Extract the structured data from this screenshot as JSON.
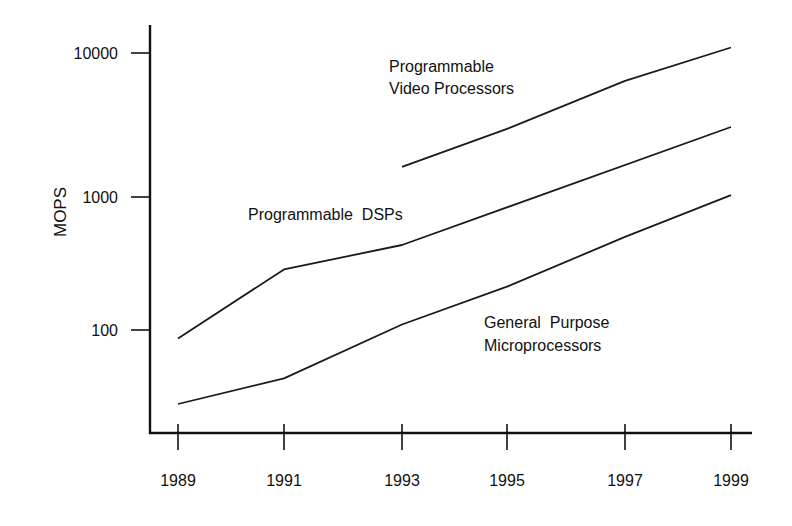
{
  "chart_data": {
    "type": "line",
    "title": "",
    "xlabel": "",
    "ylabel": "MOPS",
    "yscale": "log",
    "ylim": [
      20,
      14000
    ],
    "xlim": [
      1988.5,
      1999.4
    ],
    "grid": false,
    "legend": "inline labels",
    "x_ticks": [
      1989,
      1991,
      1993,
      1995,
      1997,
      1999
    ],
    "x_tick_labels": [
      "1989",
      "1991",
      "1993",
      "1995",
      "1997",
      "1999"
    ],
    "y_ticks": [
      100,
      1000,
      10000
    ],
    "y_tick_labels": [
      "100",
      "1000",
      "10000"
    ],
    "series": [
      {
        "name": "Programmable Video Processors",
        "label_lines": [
          "Programmable",
          "Video Processors"
        ],
        "x": [
          1993,
          1995,
          1997,
          1999
        ],
        "values": [
          1650,
          3100,
          6900,
          12000
        ]
      },
      {
        "name": "Programmable DSPs",
        "label_lines": [
          "Programmable  DSPs"
        ],
        "x": [
          1989,
          1991,
          1993,
          1999
        ],
        "values": [
          95,
          300,
          450,
          3200
        ]
      },
      {
        "name": "General Purpose Microprocessors",
        "label_lines": [
          "General  Purpose",
          "Microprocessors"
        ],
        "x": [
          1989,
          1991,
          1993,
          1995,
          1997,
          1999
        ],
        "values": [
          32,
          49,
          120,
          225,
          515,
          1030
        ]
      }
    ]
  }
}
